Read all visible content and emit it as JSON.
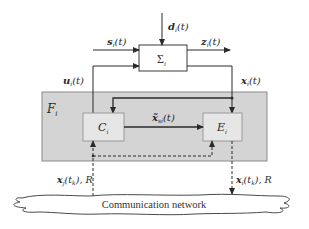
{
  "diagram": {
    "type": "block-diagram",
    "blocks": {
      "plant": {
        "label": "Σ",
        "subscript": "i"
      },
      "framework": {
        "label": "F",
        "subscript": "i"
      },
      "controller": {
        "label": "C",
        "subscript": "i"
      },
      "estimator": {
        "label": "E",
        "subscript": "i"
      },
      "network": {
        "label": "Communication network"
      }
    },
    "signals": {
      "disturbance": {
        "symbol": "d",
        "subscript": "i",
        "arg": "(t)"
      },
      "input_s": {
        "symbol": "s",
        "subscript": "i",
        "arg": "(t)"
      },
      "output_z": {
        "symbol": "z",
        "subscript": "i",
        "arg": "(t)"
      },
      "control_u": {
        "symbol": "u",
        "subscript": "i",
        "arg": "(t)"
      },
      "state_x": {
        "symbol": "x",
        "subscript": "i",
        "arg": "(t)"
      },
      "estimate": {
        "symbol": "x̃",
        "subscript": "si",
        "arg": "(t)"
      },
      "net_in": {
        "symbol": "x",
        "subscript": "j",
        "arg": "(t",
        "arg_sub": "k",
        "arg_end": "), R"
      },
      "net_out": {
        "symbol": "x",
        "subscript": "i",
        "arg": "(t",
        "arg_sub": "k",
        "arg_end": "), R"
      }
    },
    "colors": {
      "framework_fill": "#d4d4d4",
      "inner_box_fill": "#e6e6e6",
      "line": "#3a3a3a"
    }
  }
}
